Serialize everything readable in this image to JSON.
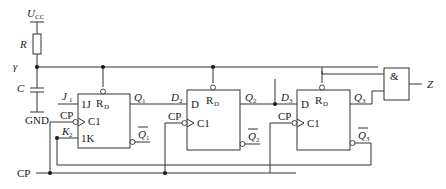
{
  "diagram": {
    "type": "circuit-schematic",
    "power": {
      "label": "U",
      "sub": "CC"
    },
    "resistor": {
      "label": "R"
    },
    "capacitor": {
      "label": "C"
    },
    "ground": {
      "label": "GND"
    },
    "switch_symbol": "γ",
    "ff1": {
      "j_label": "J",
      "j_sub": "1",
      "k_label": "K",
      "k_sub": "2",
      "cp_label": "CP",
      "pin_1j": "1J",
      "pin_c1": "C1",
      "pin_1k": "1K",
      "rd": "R",
      "rd_sub": "D",
      "q": "Q",
      "q_sub": "1",
      "qbar": "Q",
      "qbar_sub": "1"
    },
    "ff2": {
      "d_label": "D",
      "d_sub": "2",
      "cp_label": "CP",
      "pin_d": "D",
      "pin_c1": "C1",
      "rd": "R",
      "rd_sub": "D",
      "q": "Q",
      "q_sub": "2",
      "qbar": "Q",
      "qbar_sub": "2"
    },
    "ff3": {
      "d_label": "D",
      "d_sub": "3",
      "cp_label": "CP",
      "pin_d": "D",
      "pin_c1": "C1",
      "rd": "R",
      "rd_sub": "D",
      "q": "Q",
      "q_sub": "3",
      "qbar": "Q",
      "qbar_sub": "3"
    },
    "and_gate": {
      "symbol": "&",
      "output": "Z"
    },
    "clock": {
      "label": "CP"
    }
  }
}
